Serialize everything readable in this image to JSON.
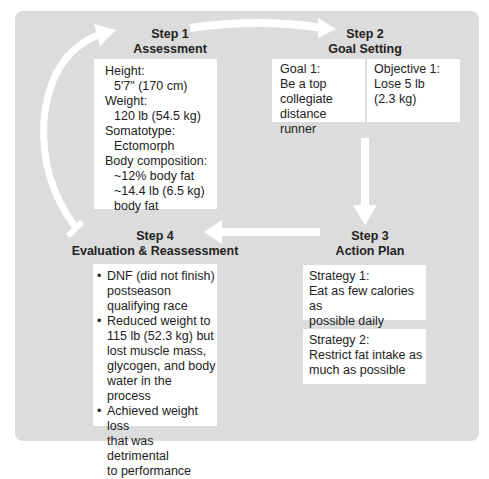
{
  "steps": {
    "step1": {
      "number": "Step 1",
      "title": "Assessment",
      "items": [
        {
          "label": "Height:",
          "value": "5'7\" (170 cm)"
        },
        {
          "label": "Weight:",
          "value": "120 lb (54.5 kg)"
        },
        {
          "label": "Somatotype:",
          "value": "Ectomorph"
        },
        {
          "label": "Body composition:",
          "values": [
            "~12% body fat",
            "~14.4 lb (6.5 kg)",
            "body fat"
          ]
        }
      ]
    },
    "step2": {
      "number": "Step 2",
      "title": "Goal Setting",
      "goal": {
        "label": "Goal 1:",
        "lines": [
          "Be a top",
          "collegiate",
          "distance runner"
        ]
      },
      "objective": {
        "label": "Objective 1:",
        "lines": [
          "Lose 5 lb",
          "(2.3 kg)"
        ]
      }
    },
    "step3": {
      "number": "Step 3",
      "title": "Action Plan",
      "strategies": [
        {
          "label": "Strategy 1:",
          "lines": [
            "Eat as few calories as",
            "possible daily"
          ]
        },
        {
          "label": "Strategy 2:",
          "lines": [
            "Restrict fat intake as",
            "much as possible"
          ]
        }
      ]
    },
    "step4": {
      "number": "Step 4",
      "title": "Evaluation & Reassessment",
      "bullets": [
        [
          "DNF (did not finish)",
          "postseason",
          "qualifying race"
        ],
        [
          "Reduced weight to",
          "115 lb (52.3 kg) but",
          "lost muscle mass,",
          "glycogen, and body",
          "water in the process"
        ],
        [
          "Achieved weight loss",
          "that was detrimental",
          "to performance"
        ]
      ]
    }
  },
  "colors": {
    "panel": "#dcdcdc",
    "box": "#ffffff",
    "arrow": "#ffffff",
    "text": "#222222"
  }
}
